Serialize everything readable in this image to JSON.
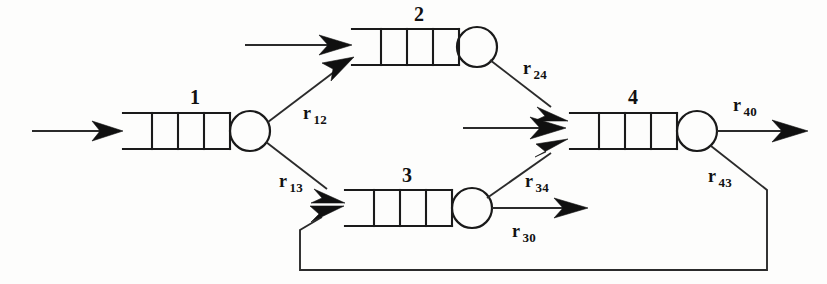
{
  "diagram": {
    "type": "queueing-network",
    "background_color": "#fdfdfc",
    "line_color": "#1a1a1a"
  },
  "stations": [
    {
      "id": "station-1",
      "label": "1",
      "queue_slots": 4,
      "x": 123,
      "y": 113,
      "width": 107,
      "height": 36,
      "server_cx": 250,
      "server_cy": 131,
      "server_r": 20,
      "label_x": 190,
      "label_y": 87
    },
    {
      "id": "station-2",
      "label": "2",
      "queue_slots": 4,
      "x": 352,
      "y": 29,
      "width": 107,
      "height": 36,
      "server_cx": 477,
      "server_cy": 47,
      "server_r": 20,
      "label_x": 414,
      "label_y": 4
    },
    {
      "id": "station-3",
      "label": "3",
      "queue_slots": 4,
      "x": 345,
      "y": 190,
      "width": 107,
      "height": 36,
      "server_cx": 472,
      "server_cy": 208,
      "server_r": 20,
      "label_x": 402,
      "label_y": 165
    },
    {
      "id": "station-4",
      "label": "4",
      "queue_slots": 4,
      "x": 570,
      "y": 113,
      "width": 107,
      "height": 36,
      "server_cx": 697,
      "server_cy": 131,
      "server_r": 20,
      "label_x": 628,
      "label_y": 87
    }
  ],
  "external_arrivals": [
    {
      "id": "arrival-station-1",
      "from_x": 32,
      "from_y": 131,
      "to_x": 123,
      "to_y": 131
    },
    {
      "id": "arrival-station-2",
      "from_x": 245,
      "from_y": 45,
      "to_x": 352,
      "to_y": 45
    },
    {
      "id": "arrival-station-4",
      "from_x": 463,
      "from_y": 128,
      "to_x": 570,
      "to_y": 128
    }
  ],
  "routes": [
    {
      "id": "route-r12",
      "label_base": "r",
      "label_sub": "12",
      "from": "station-1-server",
      "to": "station-2-queue",
      "from_x": 268,
      "from_y": 122,
      "to_x": 352,
      "to_y": 58,
      "label_x": 303,
      "label_y": 104
    },
    {
      "id": "route-r13",
      "label_base": "r",
      "label_sub": "13",
      "from": "station-1-server",
      "to": "station-3-queue",
      "from_x": 266,
      "from_y": 142,
      "to_x": 345,
      "to_y": 203,
      "label_x": 279,
      "label_y": 172
    },
    {
      "id": "route-r24",
      "label_base": "r",
      "label_sub": "24",
      "from": "station-2-server",
      "to": "station-4-queue",
      "from_x": 490,
      "from_y": 60,
      "to_x": 570,
      "to_y": 122,
      "label_x": 523,
      "label_y": 59
    },
    {
      "id": "route-r34",
      "label_base": "r",
      "label_sub": "34",
      "from": "station-3-server",
      "to": "station-4-queue",
      "from_x": 487,
      "from_y": 198,
      "to_x": 570,
      "to_y": 136,
      "label_x": 525,
      "label_y": 172
    },
    {
      "id": "route-r30",
      "label_base": "r",
      "label_sub": "30",
      "from": "station-3-server",
      "to": "exit",
      "from_x": 492,
      "from_y": 208,
      "to_x": 588,
      "to_y": 208,
      "label_x": 512,
      "label_y": 222
    },
    {
      "id": "route-r40",
      "label_base": "r",
      "label_sub": "40",
      "from": "station-4-server",
      "to": "exit",
      "from_x": 717,
      "from_y": 131,
      "to_x": 808,
      "to_y": 131,
      "label_x": 733,
      "label_y": 96
    },
    {
      "id": "route-r43",
      "label_base": "r",
      "label_sub": "43",
      "from": "station-4-server",
      "to": "station-3-queue",
      "path": "M 711,146 L 767,190 L 767,270 L 300,270 L 300,228 L 340,206",
      "label_x": 708,
      "label_y": 167
    }
  ]
}
